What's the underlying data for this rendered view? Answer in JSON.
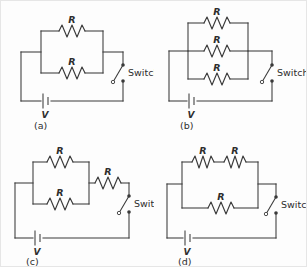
{
  "figure": {
    "background_color": "#fdfdfd",
    "line_color": "#3a3a3a",
    "panel_count": 4
  },
  "labels": {
    "resistor": "R",
    "voltage": "V",
    "switch": "Switch"
  },
  "panels": [
    {
      "id": "a",
      "caption": "(a)",
      "description": "Two resistors in parallel with a battery and an open switch",
      "resistor_count": 2,
      "resistors": [
        "R",
        "R"
      ],
      "topology": "two-parallel",
      "battery_label": "V",
      "switch_label": "Switch",
      "switch_state": "open"
    },
    {
      "id": "b",
      "caption": "(b)",
      "description": "Three resistors in parallel with a battery and an open switch",
      "resistor_count": 3,
      "resistors": [
        "R",
        "R",
        "R"
      ],
      "topology": "three-parallel",
      "battery_label": "V",
      "switch_label": "Switch",
      "switch_state": "open"
    },
    {
      "id": "c",
      "caption": "(c)",
      "description": "Two resistors in parallel in series with a third resistor, battery and open switch",
      "resistor_count": 3,
      "resistors": [
        "R",
        "R",
        "R"
      ],
      "topology": "two-parallel-plus-series",
      "battery_label": "V",
      "switch_label": "Switch",
      "switch_state": "open"
    },
    {
      "id": "d",
      "caption": "(d)",
      "description": "Two series resistors in parallel with a third resistor, battery and open switch",
      "resistor_count": 3,
      "resistors": [
        "R",
        "R",
        "R"
      ],
      "topology": "series-pair-parallel-single",
      "battery_label": "V",
      "switch_label": "Switch",
      "switch_state": "open"
    }
  ]
}
